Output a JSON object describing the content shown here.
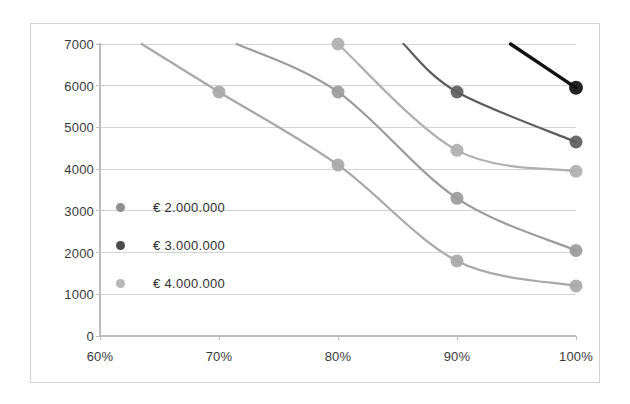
{
  "chart_data": {
    "type": "line",
    "title": "",
    "xlabel": "",
    "ylabel": "",
    "xlim": [
      60,
      100
    ],
    "ylim": [
      0,
      7000
    ],
    "grid": true,
    "legend_position": "inside-left",
    "x_tick_labels": [
      "60%",
      "70%",
      "80%",
      "90%",
      "100%"
    ],
    "x_tick_values": [
      60,
      70,
      80,
      90,
      100
    ],
    "y_tick_labels": [
      "0",
      "1000",
      "2000",
      "3000",
      "4000",
      "5000",
      "6000",
      "7000"
    ],
    "y_tick_values": [
      0,
      1000,
      2000,
      3000,
      4000,
      5000,
      6000,
      7000
    ],
    "legend": [
      {
        "label": "€ 2.000.000",
        "color": "#8f8f8f"
      },
      {
        "label": "€ 3.000.000",
        "color": "#4a4a4a"
      },
      {
        "label": "€ 4.000.000",
        "color": "#b8b8b8"
      }
    ],
    "series": [
      {
        "name": "curve-1",
        "color": "#a8a8a8",
        "x": [
          63.5,
          70,
          80,
          90,
          100
        ],
        "y": [
          7000,
          5850,
          4100,
          1800,
          1200
        ],
        "markers_x": [
          70,
          80,
          90,
          100
        ],
        "markers_y": [
          5850,
          4100,
          1800,
          1200
        ]
      },
      {
        "name": "curve-2",
        "color": "#9b9b9b",
        "x": [
          71.5,
          80,
          90,
          100
        ],
        "y": [
          7000,
          5850,
          3300,
          2050
        ],
        "markers_x": [
          80,
          90,
          100
        ],
        "markers_y": [
          5850,
          3300,
          2050
        ]
      },
      {
        "name": "curve-3",
        "color": "#b0b0b0",
        "x": [
          80,
          90,
          100
        ],
        "y": [
          7000,
          4450,
          3950
        ],
        "markers_x": [
          80,
          90,
          100
        ],
        "markers_y": [
          7000,
          4450,
          3950
        ]
      },
      {
        "name": "curve-4",
        "color": "#5d5d5d",
        "x": [
          85.5,
          90,
          100
        ],
        "y": [
          7000,
          5850,
          4650
        ],
        "markers_x": [
          90,
          100
        ],
        "markers_y": [
          5850,
          4650
        ]
      },
      {
        "name": "curve-5",
        "color": "#111111",
        "x": [
          94.5,
          100
        ],
        "y": [
          7000,
          5950
        ],
        "markers_x": [
          100
        ],
        "markers_y": [
          5950
        ]
      }
    ],
    "axis_color": "#bdbdbd",
    "grid_color": "#c9c9c9",
    "frame_color": "#d2d2d2",
    "text_color": "#3a3a3a",
    "background": "#ffffff"
  }
}
